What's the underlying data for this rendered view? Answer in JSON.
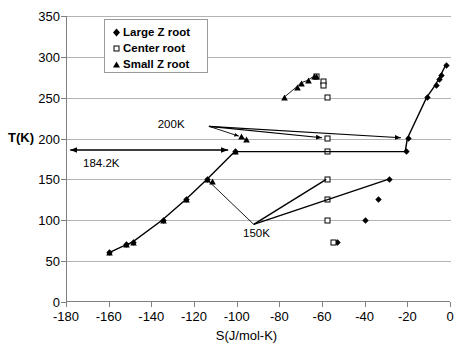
{
  "chart_data": {
    "type": "scatter",
    "title": "",
    "xlabel": "S(J/mol-K)",
    "ylabel": "T(K)",
    "xlim": [
      -180,
      0
    ],
    "ylim": [
      0,
      350
    ],
    "xticks": [
      -180,
      -160,
      -140,
      -120,
      -100,
      -80,
      -60,
      -40,
      -20,
      0
    ],
    "yticks": [
      0,
      50,
      100,
      150,
      200,
      250,
      300,
      350
    ],
    "grid": "horizontal",
    "legend_position": "top-left",
    "series": [
      {
        "name": "Large Z root",
        "marker": "filled-diamond",
        "points": [
          [
            -160,
            60
          ],
          [
            -152,
            70
          ],
          [
            -149,
            73
          ],
          [
            -135,
            100
          ],
          [
            -124,
            125
          ],
          [
            -114,
            150
          ],
          [
            -101,
            184
          ],
          [
            -21,
            184
          ],
          [
            -20,
            200
          ],
          [
            -11,
            250
          ],
          [
            -7,
            265
          ],
          [
            -5.5,
            272
          ],
          [
            -4.5,
            277
          ],
          [
            -2,
            290
          ],
          [
            -29,
            150
          ],
          [
            -34,
            125
          ],
          [
            -40,
            100
          ],
          [
            -53,
            73
          ]
        ]
      },
      {
        "name": "Center root",
        "marker": "open-square",
        "points": [
          [
            -63,
            276
          ],
          [
            -60,
            270
          ],
          [
            -60,
            265
          ],
          [
            -58,
            250
          ],
          [
            -58,
            200
          ],
          [
            -58,
            184
          ],
          [
            -58,
            150
          ],
          [
            -58,
            125
          ],
          [
            -58,
            100
          ],
          [
            -55,
            73
          ]
        ]
      },
      {
        "name": "Small Z root",
        "marker": "filled-triangle",
        "points": [
          [
            -78,
            250
          ],
          [
            -72,
            263
          ],
          [
            -70,
            268
          ],
          [
            -67,
            271
          ],
          [
            -64,
            276
          ],
          [
            -63,
            276
          ],
          [
            -98,
            202
          ],
          [
            -96,
            199
          ],
          [
            -160,
            60
          ],
          [
            -152,
            70
          ],
          [
            -149,
            73
          ],
          [
            -135,
            100
          ],
          [
            -124,
            125
          ],
          [
            -114,
            150
          ],
          [
            -112,
            147
          ],
          [
            -101,
            184
          ]
        ]
      }
    ],
    "annotations": [
      {
        "label": "200K",
        "x": -118,
        "y": 218
      },
      {
        "label": "184.2K",
        "x": -163,
        "y": 171
      },
      {
        "label": "150K",
        "x": -90,
        "y": 84
      }
    ]
  },
  "legend": {
    "items": [
      {
        "label": "Large Z root",
        "marker": "filled-diamond"
      },
      {
        "label": "Center root",
        "marker": "open-square"
      },
      {
        "label": "Small Z root",
        "marker": "filled-triangle"
      }
    ]
  },
  "axes": {
    "x_title": "S(J/mol-K)",
    "y_title": "T(K)",
    "x_labels": [
      "-180",
      "-160",
      "-140",
      "-120",
      "-100",
      "-80",
      "-60",
      "-40",
      "-20",
      "0"
    ],
    "y_labels": [
      "0",
      "50",
      "100",
      "150",
      "200",
      "250",
      "300",
      "350"
    ]
  },
  "annotations": {
    "a200k": "200K",
    "a1842k": "184.2K",
    "a150k": "150K"
  },
  "colors": {
    "marker": "#000000",
    "grid": "#b3b3b3",
    "axis": "#808080",
    "background": "#ffffff"
  }
}
